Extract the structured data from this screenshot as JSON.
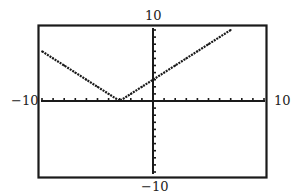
{
  "chart_data": {
    "type": "line",
    "title": "",
    "xlabel": "",
    "ylabel": "",
    "xlim": [
      -10,
      10
    ],
    "ylim": [
      -10,
      10
    ],
    "xscl": 1,
    "yscl": 1,
    "grid": false,
    "window_labels": {
      "xmin": "−10",
      "xmax": "10",
      "ymin": "−10",
      "ymax": "10"
    },
    "series": [
      {
        "name": "y = |x + 3|",
        "style": "dotted-pixel",
        "color": "#1a1a1a",
        "x": [
          -10,
          -9,
          -8,
          -7,
          -6,
          -5,
          -4,
          -3,
          -2,
          -1,
          0,
          1,
          2,
          3,
          4,
          5,
          6,
          7
        ],
        "y": [
          7,
          6,
          5,
          4,
          3,
          2,
          1,
          0,
          1,
          2,
          3,
          4,
          5,
          6,
          7,
          8,
          9,
          10
        ]
      }
    ]
  }
}
